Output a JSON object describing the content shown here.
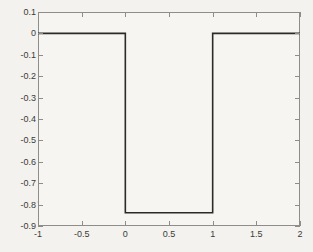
{
  "chart_data": {
    "type": "line",
    "title": "",
    "xlabel": "",
    "ylabel": "",
    "xlim": [
      -1,
      2
    ],
    "ylim": [
      -0.9,
      0.1
    ],
    "grid": false,
    "legend": null,
    "xticks": [
      -1,
      -0.5,
      0,
      0.5,
      1,
      1.5,
      2
    ],
    "xtick_labels": [
      "-1",
      "-0.5",
      "0",
      "0.5",
      "1",
      "1.5",
      "2"
    ],
    "yticks": [
      0.1,
      0,
      -0.1,
      -0.2,
      -0.3,
      -0.4,
      -0.5,
      -0.6,
      -0.7,
      -0.8,
      -0.9
    ],
    "ytick_labels": [
      "0.1",
      "0",
      "-0.1",
      "-0.2",
      "-0.3",
      "-0.4",
      "-0.5",
      "-0.6",
      "-0.7",
      "-0.8",
      "-0.9"
    ],
    "series": [
      {
        "name": "square pulse",
        "color": "#2b2a28",
        "linewidth": 1.6,
        "x": [
          -1,
          0,
          0,
          1,
          1,
          2
        ],
        "y": [
          0,
          0,
          -0.838,
          -0.838,
          0,
          0
        ]
      }
    ],
    "annotations": []
  },
  "figure": {
    "background_color": "#f3f2ee",
    "axes_background_color": "#f6f5f1",
    "axes_edge_color": "#8e8d89",
    "tick_label_color": "#3b3a38"
  }
}
